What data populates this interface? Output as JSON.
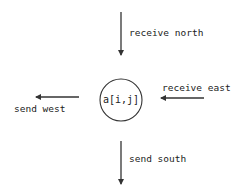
{
  "diagram": {
    "node": {
      "label": "a[i,j]",
      "cx": 121,
      "cy": 100,
      "r": 21
    },
    "arrows": [
      {
        "id": "receive-north",
        "label": "receive north",
        "x1": 121,
        "y1": 12,
        "x2": 121,
        "y2": 55
      },
      {
        "id": "receive-east",
        "label": "receive east",
        "x1": 204,
        "y1": 98,
        "x2": 161,
        "y2": 98
      },
      {
        "id": "send-west",
        "label": "send west",
        "x1": 79,
        "y1": 97,
        "x2": 36,
        "y2": 97
      },
      {
        "id": "send-south",
        "label": "send south",
        "x1": 121,
        "y1": 141,
        "x2": 121,
        "y2": 184
      }
    ],
    "colors": {
      "stroke": "#333333",
      "text": "#222222",
      "background": "#ffffff"
    }
  }
}
